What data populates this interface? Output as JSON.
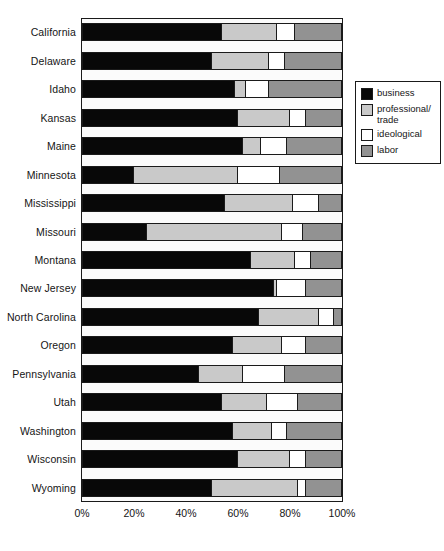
{
  "chart_data": {
    "type": "bar",
    "orientation": "horizontal",
    "stacked": true,
    "normalized": true,
    "title": "",
    "subtitle": "",
    "xlabel": "",
    "ylabel": "",
    "xlim": [
      0,
      100
    ],
    "grid": false,
    "legend_position": "right",
    "xticks": [
      "0%",
      "20%",
      "40%",
      "60%",
      "80%",
      "100%"
    ],
    "xtick_values": [
      0,
      20,
      40,
      60,
      80,
      100
    ],
    "categories": [
      "California",
      "Delaware",
      "Idaho",
      "Kansas",
      "Maine",
      "Minnesota",
      "Mississippi",
      "Missouri",
      "Montana",
      "New Jersey",
      "North Carolina",
      "Oregon",
      "Pennsylvania",
      "Utah",
      "Washington",
      "Wisconsin",
      "Wyoming"
    ],
    "series": [
      {
        "name": "business",
        "color": "#080808",
        "values": [
          54,
          50,
          59,
          60,
          62,
          20,
          55,
          25,
          65,
          74,
          68,
          58,
          45,
          54,
          58,
          60,
          50
        ]
      },
      {
        "name": "professional/trade",
        "color": "#c9c9c9",
        "values": [
          21,
          22,
          4,
          20,
          7,
          40,
          26,
          52,
          17,
          1,
          23,
          19,
          17,
          17,
          15,
          20,
          33
        ]
      },
      {
        "name": "ideological",
        "color": "#ffffff",
        "values": [
          7,
          6,
          9,
          6,
          10,
          16,
          10,
          8,
          6,
          11,
          6,
          9,
          16,
          12,
          6,
          6,
          3
        ]
      },
      {
        "name": "labor",
        "color": "#929292",
        "values": [
          18,
          22,
          28,
          14,
          21,
          24,
          9,
          15,
          12,
          14,
          3,
          14,
          22,
          17,
          21,
          14,
          14
        ]
      }
    ],
    "legend": [
      {
        "label": "business",
        "color": "#080808"
      },
      {
        "label": "professional/\ntrade",
        "color": "#c9c9c9"
      },
      {
        "label": "ideological",
        "color": "#ffffff"
      },
      {
        "label": "labor",
        "color": "#929292"
      }
    ]
  }
}
